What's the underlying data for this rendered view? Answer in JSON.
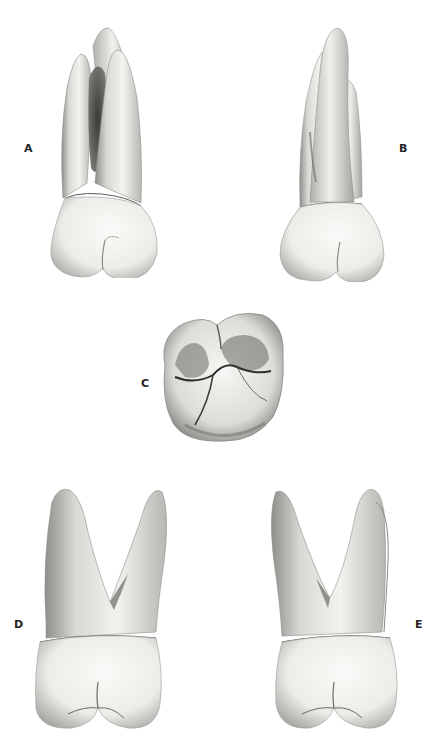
{
  "figure": {
    "panels": [
      {
        "id": "A",
        "label": "A",
        "view": "tooth-view-a"
      },
      {
        "id": "B",
        "label": "B",
        "view": "tooth-view-b"
      },
      {
        "id": "C",
        "label": "C",
        "view": "occlusal-view"
      },
      {
        "id": "D",
        "label": "D",
        "view": "tooth-view-d"
      },
      {
        "id": "E",
        "label": "E",
        "view": "tooth-view-e"
      }
    ],
    "colors": {
      "background": "#ffffff",
      "tooth_light": "#f4f4f2",
      "tooth_shade": "#9a9a96",
      "tooth_dark": "#3c3c3a",
      "label": "#222222"
    }
  }
}
